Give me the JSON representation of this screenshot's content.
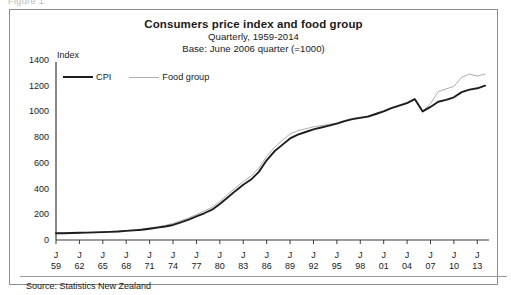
{
  "figure_caption": "Figure 1",
  "header": {
    "title": "Consumers price index and food group",
    "subtitle": "Quarterly, 1959-2014",
    "base": "Base: June 2006 quarter (=1000)"
  },
  "axis_unit_label": "Index",
  "legend": {
    "items": [
      {
        "label": "CPI",
        "color": "#1d1d1d"
      },
      {
        "label": "Food group",
        "color": "#adadad"
      }
    ]
  },
  "source": "Source: Statistics New Zealand",
  "colors": {
    "cpi": "#1d1d1d",
    "food": "#adadad",
    "axis": "#3b3b3b",
    "frame": "#8e8e8e"
  },
  "chart_data": {
    "type": "line",
    "title": "Consumers price index and food group",
    "subtitle": "Quarterly, 1959-2014",
    "note": "Base: June 2006 quarter (=1000)",
    "xlabel": "",
    "ylabel": "Index",
    "ylim": [
      0,
      1400
    ],
    "ytick_step": 200,
    "yticks": [
      0,
      200,
      400,
      600,
      800,
      1000,
      1200,
      1400
    ],
    "grid": false,
    "legend_position": "top-left",
    "xtick_prefix": "J",
    "xtick_labels": [
      "59",
      "62",
      "65",
      "68",
      "71",
      "74",
      "77",
      "80",
      "83",
      "86",
      "89",
      "92",
      "95",
      "98",
      "01",
      "04",
      "07",
      "10",
      "13"
    ],
    "x": [
      1959,
      1962,
      1965,
      1968,
      1971,
      1974,
      1977,
      1980,
      1983,
      1986,
      1989,
      1992,
      1995,
      1998,
      2001,
      2004,
      2007,
      2010,
      2013,
      2014
    ],
    "xlim": [
      1959,
      2014.5
    ],
    "series": [
      {
        "name": "CPI",
        "color": "#1d1d1d",
        "x": [
          1959,
          1960,
          1961,
          1962,
          1963,
          1964,
          1965,
          1966,
          1967,
          1968,
          1969,
          1970,
          1971,
          1972,
          1973,
          1974,
          1975,
          1976,
          1977,
          1978,
          1979,
          1980,
          1981,
          1982,
          1983,
          1984,
          1985,
          1986,
          1987,
          1988,
          1989,
          1990,
          1991,
          1992,
          1993,
          1994,
          1995,
          1996,
          1997,
          1998,
          1999,
          2000,
          2001,
          2002,
          2003,
          2004,
          2005,
          2006,
          2007,
          2008,
          2009,
          2010,
          2011,
          2012,
          2013,
          2014
        ],
        "values": [
          52,
          53,
          54,
          56,
          57,
          59,
          61,
          63,
          66,
          71,
          75,
          80,
          88,
          96,
          105,
          117,
          137,
          158,
          183,
          208,
          236,
          280,
          330,
          382,
          430,
          470,
          530,
          620,
          690,
          740,
          790,
          820,
          840,
          860,
          875,
          890,
          905,
          925,
          940,
          950,
          960,
          980,
          1000,
          1025,
          1045,
          1065,
          1095,
          1000,
          1035,
          1075,
          1090,
          1110,
          1150,
          1170,
          1180,
          1200
        ],
        "label_last": 1200
      },
      {
        "name": "Food group",
        "color": "#adadad",
        "x": [
          1959,
          1960,
          1961,
          1962,
          1963,
          1964,
          1965,
          1966,
          1967,
          1968,
          1969,
          1970,
          1971,
          1972,
          1973,
          1974,
          1975,
          1976,
          1977,
          1978,
          1979,
          1980,
          1981,
          1982,
          1983,
          1984,
          1985,
          1986,
          1987,
          1988,
          1989,
          1990,
          1991,
          1992,
          1993,
          1994,
          1995,
          1996,
          1997,
          1998,
          1999,
          2000,
          2001,
          2002,
          2003,
          2004,
          2005,
          2006,
          2007,
          2008,
          2009,
          2010,
          2011,
          2012,
          2013,
          2014
        ],
        "values": [
          53,
          54,
          55,
          57,
          59,
          61,
          63,
          66,
          69,
          74,
          79,
          85,
          94,
          103,
          114,
          128,
          150,
          172,
          198,
          225,
          255,
          300,
          355,
          405,
          455,
          495,
          560,
          650,
          720,
          775,
          825,
          850,
          865,
          880,
          890,
          900,
          910,
          930,
          945,
          955,
          965,
          985,
          1005,
          1030,
          1050,
          1070,
          1100,
          1000,
          1060,
          1155,
          1175,
          1195,
          1265,
          1290,
          1275,
          1290
        ],
        "label_last": 1290
      }
    ]
  }
}
